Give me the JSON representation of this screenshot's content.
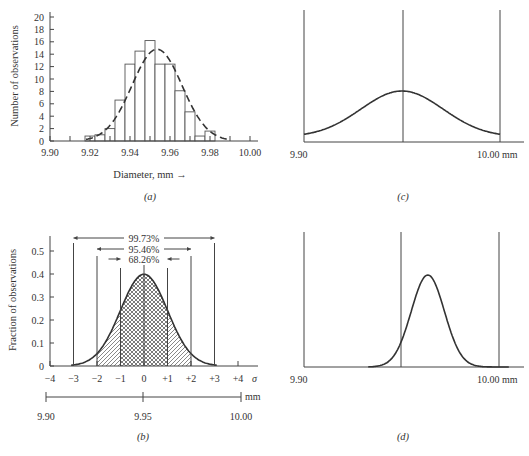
{
  "figure": {
    "panels": [
      "a",
      "b",
      "c",
      "d"
    ]
  },
  "chart_data": [
    {
      "id": "a",
      "type": "bar",
      "caption": "(a)",
      "xlabel": "Diameter, mm →",
      "ylabel": "Number of observations",
      "x_ticks": [
        "9.90",
        "9.92",
        "9.94",
        "9.96",
        "9.98",
        "10.00"
      ],
      "y_ticks": [
        "0",
        "2",
        "4",
        "6",
        "8",
        "10",
        "12",
        "14",
        "16",
        "18",
        "20"
      ],
      "xlim": [
        9.9,
        10.0
      ],
      "ylim": [
        0,
        20
      ],
      "bin_width": 0.005,
      "bins_start": [
        9.9175,
        9.9225,
        9.9275,
        9.9325,
        9.9375,
        9.9425,
        9.9475,
        9.9525,
        9.9575,
        9.9625,
        9.9675,
        9.9725,
        9.9775
      ],
      "values": [
        0.8,
        1.0,
        2.0,
        6.6,
        12.4,
        14.5,
        16.2,
        12.4,
        12.4,
        8.1,
        4.7,
        0.8,
        1.6
      ],
      "overlay": {
        "type": "normal-curve",
        "style": "dashed",
        "mean": 9.9535,
        "sigma": 0.0125,
        "peak": 14.8
      }
    },
    {
      "id": "b",
      "type": "area",
      "caption": "(b)",
      "ylabel": "Fraction of observations",
      "y_ticks": [
        "0",
        "0.1",
        "0.2",
        "0.3",
        "0.4",
        "0.5"
      ],
      "ylim": [
        0,
        0.55
      ],
      "sigma_ticks": [
        "−4",
        "−3",
        "−2",
        "−1",
        "0",
        "+1",
        "+2",
        "+3",
        "+4"
      ],
      "sigma_label": "σ",
      "mm_scale": {
        "labels": [
          "9.90",
          "9.95",
          "10.00"
        ],
        "unit": "mm"
      },
      "curve": {
        "mean": 0,
        "sigma": 1,
        "peak": 0.399
      },
      "intervals": [
        {
          "label": "68.26%",
          "range": [
            -1,
            1
          ],
          "fill": "crosshatch"
        },
        {
          "label": "95.46%",
          "range": [
            -2,
            2
          ],
          "fill": "diagonal-hatch"
        },
        {
          "label": "99.73%",
          "range": [
            -3,
            3
          ],
          "fill": "none"
        }
      ]
    },
    {
      "id": "c",
      "type": "line",
      "caption": "(c)",
      "x_labels": [
        "9.90",
        "10.00 mm"
      ],
      "limits": [
        9.9,
        9.95,
        10.0
      ],
      "curve": {
        "mean": 9.95,
        "sigma": 0.021,
        "shape": "wide-flat"
      }
    },
    {
      "id": "d",
      "type": "line",
      "caption": "(d)",
      "x_labels": [
        "9.90",
        "10.00 mm"
      ],
      "limits": [
        9.9,
        9.95,
        10.0
      ],
      "curve": {
        "mean": 9.9635,
        "sigma": 0.0085,
        "shape": "narrow-shifted"
      }
    }
  ]
}
